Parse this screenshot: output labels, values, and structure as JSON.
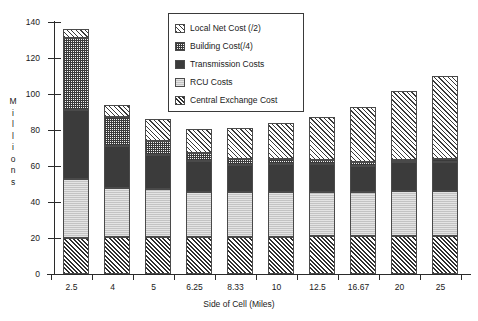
{
  "chart_data": {
    "type": "bar",
    "stacked": true,
    "title": "",
    "subtitle": "",
    "xlabel": "Side of Cell (Miles)",
    "ylabel": "Millions",
    "grid": false,
    "legend_position": "top-center-inside",
    "categories": [
      "2.5",
      "4",
      "5",
      "6.25",
      "8.33",
      "10",
      "12.5",
      "16.67",
      "20",
      "25"
    ],
    "ylim": [
      0,
      140
    ],
    "yticks": [
      0,
      20,
      40,
      60,
      80,
      100,
      120,
      140
    ],
    "series": [
      {
        "name": "Central Exchange Cost",
        "pattern": "central",
        "values": [
          20,
          20.5,
          20.5,
          20.5,
          20.5,
          20.5,
          21,
          21,
          21,
          21
        ]
      },
      {
        "name": "RCU Costs",
        "pattern": "rcu",
        "values": [
          33,
          27.5,
          26.5,
          25,
          25,
          25,
          24.5,
          24.5,
          25,
          25
        ]
      },
      {
        "name": "Transmission Costs",
        "pattern": "transmission",
        "values": [
          38,
          23,
          19,
          17.5,
          15,
          15.5,
          15.5,
          14.5,
          16,
          16.5
        ]
      },
      {
        "name": "Building Cost(/4)",
        "pattern": "building",
        "values": [
          40,
          16,
          8,
          4.5,
          3.5,
          3,
          2.5,
          2,
          1.5,
          1.5
        ]
      },
      {
        "name": "Local Net Cost (/2)",
        "pattern": "localnet",
        "values": [
          5,
          7,
          12,
          13,
          17,
          20,
          23.5,
          31,
          38,
          46
        ]
      }
    ],
    "totals": [
      136,
      94,
      86,
      80.5,
      81,
      84,
      87,
      93,
      101.5,
      110
    ]
  },
  "axes": {
    "y_title_letters": [
      "M",
      "i",
      "l",
      "l",
      "i",
      "o",
      "n",
      "s"
    ],
    "y_tick_labels": [
      "140",
      "120",
      "100",
      "80",
      "60",
      "40",
      "20",
      "0"
    ],
    "x_tick_labels": [
      "2.5",
      "4",
      "5",
      "6.25",
      "8.33",
      "10",
      "12.5",
      "16.67",
      "20",
      "25"
    ],
    "x_title": "Side of Cell (Miles)"
  },
  "legend": {
    "items": [
      {
        "label": "Local Net Cost (/2)",
        "pattern": "localnet"
      },
      {
        "label": "Building Cost(/4)",
        "pattern": "building"
      },
      {
        "label": "Transmission Costs",
        "pattern": "transmission"
      },
      {
        "label": "RCU Costs",
        "pattern": "rcu"
      },
      {
        "label": "Central Exchange Cost",
        "pattern": "central"
      }
    ]
  },
  "colors": {
    "ink": "#1a1a1a",
    "axis": "#2b2b2b",
    "transmission_fill": "#3b3b3b",
    "rcu_fill": "#c3c3c3",
    "background": "#ffffff"
  }
}
